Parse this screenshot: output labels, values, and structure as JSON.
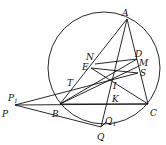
{
  "diagram": {
    "type": "geometry-figure",
    "circle": {
      "cx": 104,
      "cy": 68,
      "r": 56
    },
    "points": {
      "A": {
        "x": 127,
        "y": 19,
        "label": "A",
        "lx": 122,
        "ly": 16
      },
      "B": {
        "x": 60,
        "y": 104,
        "label": "B",
        "lx": 52,
        "ly": 117
      },
      "C": {
        "x": 148,
        "y": 104,
        "label": "C",
        "lx": 150,
        "ly": 116
      },
      "P": {
        "x": 15,
        "y": 105,
        "label": "P",
        "lx": 2,
        "ly": 117
      },
      "P1": {
        "x": 15,
        "y": 105,
        "label": "P",
        "sub": "1",
        "lx": 8,
        "ly": 101
      },
      "Q": {
        "x": 101,
        "y": 127,
        "label": "Q",
        "lx": 97,
        "ly": 140
      },
      "Q1": {
        "x": 106,
        "y": 122,
        "label": "Q",
        "sub": "1",
        "lx": 105,
        "ly": 124
      },
      "D": {
        "x": 137,
        "y": 59,
        "label": "D",
        "lx": 135,
        "ly": 57
      },
      "M": {
        "x": 139,
        "y": 66,
        "label": "M",
        "lx": 139,
        "ly": 66
      },
      "S": {
        "x": 138,
        "y": 73,
        "label": "S",
        "lx": 140,
        "ly": 76
      },
      "N": {
        "x": 95,
        "y": 64,
        "label": "N",
        "lx": 86,
        "ly": 60
      },
      "E": {
        "x": 91,
        "y": 68,
        "label": "E",
        "lx": 82,
        "ly": 70
      },
      "I": {
        "x": 115,
        "y": 78,
        "label": "I",
        "lx": 113,
        "ly": 89
      },
      "T": {
        "x": 70,
        "y": 87,
        "label": "T",
        "lx": 67,
        "ly": 86
      },
      "K": {
        "x": 112,
        "y": 104,
        "label": "K",
        "lx": 112,
        "ly": 102
      }
    },
    "segments": [
      [
        "A",
        "B"
      ],
      [
        "A",
        "C"
      ],
      [
        "B",
        "C"
      ],
      [
        "P",
        "C"
      ],
      [
        "P",
        "Q"
      ],
      [
        "A",
        "Q"
      ],
      [
        "P",
        "S"
      ],
      [
        "N",
        "D"
      ],
      [
        "E",
        "S"
      ],
      [
        "E",
        "C"
      ],
      [
        "B",
        "D"
      ],
      [
        "B",
        "M"
      ],
      [
        "Q",
        "Q1"
      ]
    ]
  }
}
